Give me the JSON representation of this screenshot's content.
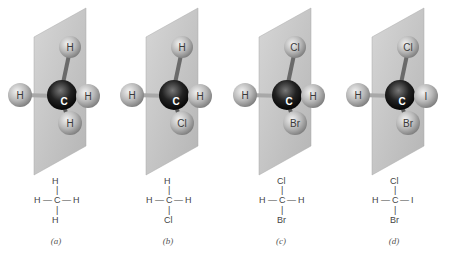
{
  "figure": {
    "panels": [
      {
        "id": "a",
        "caption": "(a)",
        "atoms": {
          "top": "H",
          "left": "H",
          "right": "H",
          "bottom": "H",
          "center": "C"
        },
        "formula": {
          "top": "H",
          "left": "H",
          "center": "C",
          "right": "H",
          "bottom": "H"
        }
      },
      {
        "id": "b",
        "caption": "(b)",
        "atoms": {
          "top": "H",
          "left": "H",
          "right": "H",
          "bottom": "Cl",
          "center": "C"
        },
        "formula": {
          "top": "H",
          "left": "H",
          "center": "C",
          "right": "H",
          "bottom": "Cl"
        }
      },
      {
        "id": "c",
        "caption": "(c)",
        "atoms": {
          "top": "Cl",
          "left": "H",
          "right": "H",
          "bottom": "Br",
          "center": "C"
        },
        "formula": {
          "top": "Cl",
          "left": "H",
          "center": "C",
          "right": "H",
          "bottom": "Br"
        }
      },
      {
        "id": "d",
        "caption": "(d)",
        "atoms": {
          "top": "Cl",
          "left": "H",
          "right": "I",
          "bottom": "Br",
          "center": "C"
        },
        "formula": {
          "top": "Cl",
          "left": "H",
          "center": "C",
          "right": "I",
          "bottom": "Br"
        }
      }
    ],
    "colors": {
      "plane": "#c9c9c9",
      "carbon": "#1a1a1a",
      "atom": "#bdbdbd",
      "bond": "#9a9a9a"
    }
  }
}
